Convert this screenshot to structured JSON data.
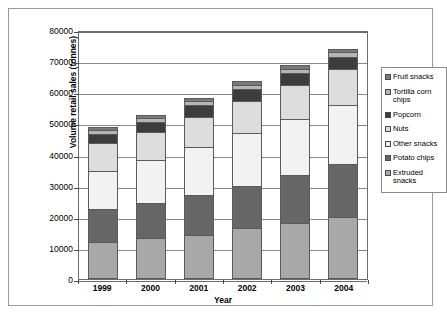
{
  "chart_data": {
    "type": "bar",
    "stacked": true,
    "title": "",
    "xlabel": "Year",
    "ylabel": "Volume retail sales (tonnes)",
    "categories": [
      "1999",
      "2000",
      "2001",
      "2002",
      "2003",
      "2004"
    ],
    "ylim": [
      0,
      80000
    ],
    "ytick_values": [
      0,
      10000,
      20000,
      30000,
      40000,
      50000,
      60000,
      70000,
      80000
    ],
    "ytick_labels": [
      "0",
      "10000",
      "20000",
      "30000",
      "40000",
      "50000",
      "60000",
      "70000",
      "80000"
    ],
    "grid": true,
    "legend_position": "right",
    "series": [
      {
        "name": "Extruded snacks",
        "color": "#a8a8a8",
        "values": [
          11800,
          13100,
          14300,
          16300,
          17900,
          20000
        ]
      },
      {
        "name": "Potato chips",
        "color": "#666666",
        "values": [
          10700,
          11400,
          12800,
          13500,
          15400,
          17000
        ]
      },
      {
        "name": "Other snacks",
        "color": "#f2f2f2",
        "values": [
          12300,
          13700,
          15200,
          17200,
          18000,
          19000
        ]
      },
      {
        "name": "Nuts",
        "color": "#dcdcdc",
        "values": [
          9000,
          9000,
          9900,
          10300,
          11000,
          11500
        ]
      },
      {
        "name": "Popcorn",
        "color": "#3d3d3d",
        "values": [
          2800,
          3400,
          3700,
          3900,
          4000,
          4000
        ]
      },
      {
        "name": "Tortilla corn chips",
        "color": "#b5b5b5",
        "values": [
          1200,
          1200,
          1200,
          1200,
          1300,
          1300
        ]
      },
      {
        "name": "Fruit snacks",
        "color": "#7a7a7a",
        "values": [
          900,
          1000,
          1000,
          1100,
          1100,
          1200
        ]
      }
    ],
    "totals": [
      48700,
      52800,
      58100,
      63500,
      68700,
      74000
    ]
  },
  "legend": {
    "entries": [
      {
        "label": "Fruit snacks",
        "color": "#7a7a7a"
      },
      {
        "label": "Tortilla corn chips",
        "color": "#b5b5b5"
      },
      {
        "label": "Popcorn",
        "color": "#3d3d3d"
      },
      {
        "label": "Nuts",
        "color": "#dcdcdc"
      },
      {
        "label": "Other snacks",
        "color": "#f2f2f2"
      },
      {
        "label": "Potato chips",
        "color": "#666666"
      },
      {
        "label": "Extruded snacks",
        "color": "#a8a8a8"
      }
    ]
  }
}
